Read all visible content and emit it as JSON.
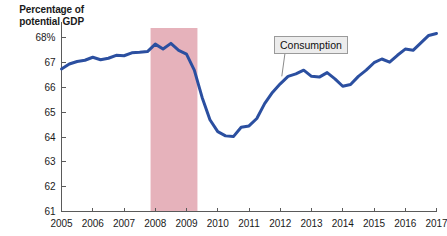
{
  "chart_data": {
    "type": "line",
    "title": "",
    "ylabel": "Percentage of potential GDP",
    "xlabel": "",
    "ylim": [
      61,
      68.4
    ],
    "xlim": [
      2005,
      2017
    ],
    "grid": false,
    "legend_position": "inline-callout",
    "ytick_labels": [
      "68%",
      "67",
      "66",
      "65",
      "64",
      "63",
      "62",
      "61"
    ],
    "ytick_values": [
      68,
      67,
      66,
      65,
      64,
      63,
      62,
      61
    ],
    "xtick_labels": [
      "2005",
      "2006",
      "2007",
      "2008",
      "2009",
      "2010",
      "2011",
      "2012",
      "2013",
      "2014",
      "2015",
      "2016",
      "2017"
    ],
    "xtick_values": [
      2005,
      2006,
      2007,
      2008,
      2009,
      2010,
      2011,
      2012,
      2013,
      2014,
      2015,
      2016,
      2017
    ],
    "series": [
      {
        "name": "Consumption",
        "color": "#2b4fa0",
        "x": [
          2005.0,
          2005.25,
          2005.5,
          2005.75,
          2006.0,
          2006.25,
          2006.5,
          2006.75,
          2007.0,
          2007.25,
          2007.5,
          2007.75,
          2008.0,
          2008.25,
          2008.5,
          2008.75,
          2009.0,
          2009.25,
          2009.5,
          2009.75,
          2010.0,
          2010.25,
          2010.5,
          2010.75,
          2011.0,
          2011.25,
          2011.5,
          2011.75,
          2012.0,
          2012.25,
          2012.5,
          2012.75,
          2013.0,
          2013.25,
          2013.5,
          2013.75,
          2014.0,
          2014.25,
          2014.5,
          2014.75,
          2015.0,
          2015.25,
          2015.5,
          2015.75,
          2016.0,
          2016.25,
          2016.5,
          2016.75,
          2017.0
        ],
        "y": [
          66.75,
          66.95,
          67.05,
          67.1,
          67.22,
          67.12,
          67.18,
          67.3,
          67.28,
          67.4,
          67.42,
          67.45,
          67.75,
          67.55,
          67.78,
          67.5,
          67.35,
          66.7,
          65.6,
          64.7,
          64.22,
          64.05,
          64.02,
          64.4,
          64.45,
          64.75,
          65.35,
          65.8,
          66.15,
          66.45,
          66.55,
          66.7,
          66.45,
          66.42,
          66.6,
          66.35,
          66.05,
          66.12,
          66.45,
          66.7,
          67.0,
          67.15,
          67.02,
          67.3,
          67.55,
          67.5,
          67.8,
          68.1,
          68.18
        ]
      }
    ],
    "shaded_regions": [
      {
        "label": "recession",
        "x_start": 2007.85,
        "x_end": 2009.35,
        "color": "#e6b2bb"
      }
    ],
    "annotations": [
      {
        "text": "Consumption",
        "box_fill": "#ececec",
        "box_border": "#9a9a9a",
        "leader_from_x": 2012.05,
        "leader_from_y": 66.45
      }
    ]
  },
  "callout": {
    "label": "Consumption"
  },
  "axis": {
    "title_line1": "Percentage of",
    "title_line2": "potential GDP"
  }
}
